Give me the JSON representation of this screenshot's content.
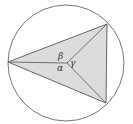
{
  "figure": {
    "type": "inscribed-triangle",
    "circle": {
      "cx": 66,
      "cy": 63,
      "r": 58,
      "stroke": "#777777"
    },
    "triangle": {
      "fill": "#dcdcdc",
      "stroke": "#666666"
    },
    "vertices": [
      [
        8,
        62
      ],
      [
        107,
        24
      ],
      [
        106,
        103
      ]
    ],
    "center": [
      67,
      63
    ],
    "labels": {
      "alpha": "α",
      "beta": "β",
      "gamma": "γ"
    }
  }
}
